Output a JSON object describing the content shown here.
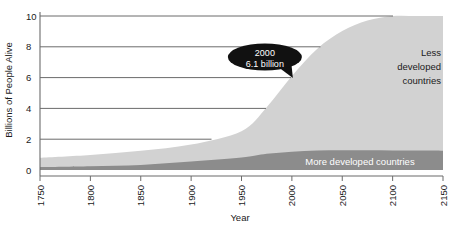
{
  "chart_data": {
    "type": "area",
    "title": "",
    "subtitle": "",
    "xlabel": "Year",
    "ylabel": "Billions of People Alive",
    "xlim": [
      1750,
      2150
    ],
    "ylim": [
      0,
      10
    ],
    "grid": true,
    "stacked": true,
    "legend_position": "inline-annotation",
    "x_ticks": [
      "1750",
      "1800",
      "1850",
      "1900",
      "1950",
      "2000",
      "2050",
      "2100",
      "2150"
    ],
    "y_ticks": [
      "0",
      "2",
      "4",
      "6",
      "8",
      "10"
    ],
    "x": [
      1750,
      1800,
      1850,
      1900,
      1950,
      1975,
      2000,
      2025,
      2050,
      2075,
      2100,
      2125,
      2150
    ],
    "series": [
      {
        "name": "More developed countries",
        "color": "#8c8c8c",
        "label_color": "#ffffff",
        "values": [
          0.19,
          0.25,
          0.33,
          0.55,
          0.81,
          1.05,
          1.19,
          1.26,
          1.28,
          1.28,
          1.27,
          1.26,
          1.25
        ]
      },
      {
        "name": "Less developed countries",
        "color": "#d2d2d2",
        "label_color": "#1a1a1a",
        "values": [
          0.61,
          0.73,
          0.92,
          1.1,
          1.71,
          3.02,
          4.91,
          6.6,
          7.74,
          8.42,
          8.73,
          8.79,
          8.8
        ]
      }
    ],
    "totals": [
      0.8,
      0.98,
      1.25,
      1.65,
      2.52,
      4.07,
      6.1,
      7.86,
      9.02,
      9.7,
      10.0,
      10.05,
      10.05
    ],
    "annotations": [
      {
        "name": "world-population-2000-callout",
        "line1": "2000",
        "line2": "6.1 billion",
        "at_x": 2000,
        "at_y": 6.1,
        "style": "speech-bubble",
        "fill": "#111111",
        "text_color": "#ffffff"
      }
    ],
    "series_labels": [
      {
        "name": "Less developed countries",
        "lines": [
          "Less",
          "developed",
          "countries"
        ],
        "align": "right"
      },
      {
        "name": "More developed countries",
        "lines": [
          "More developed countries"
        ],
        "align": "center"
      }
    ]
  },
  "colors": {
    "less_developed": "#d2d2d2",
    "more_developed": "#8c8c8c",
    "gridline": "#6b6b6b",
    "axis": "#6b6b6b",
    "text": "#1a1a1a",
    "callout": "#111111",
    "background": "#ffffff"
  }
}
